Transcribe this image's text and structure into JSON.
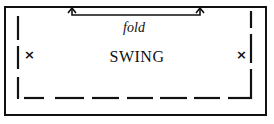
{
  "diagram": {
    "fold_label": "fold",
    "main_label": "SWING",
    "left_mark": "×",
    "right_mark": "×",
    "colors": {
      "line": "#111111",
      "background": "#ffffff"
    }
  }
}
